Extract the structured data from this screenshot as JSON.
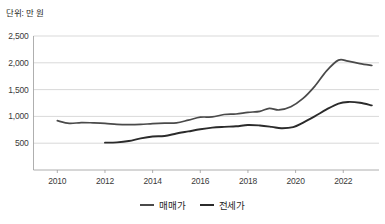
{
  "unit_note": "단위: 만 원",
  "legend": {
    "position": "bottom-center",
    "items": [
      {
        "label": "매매가",
        "color": "#4a4a4a"
      },
      {
        "label": "전세가",
        "color": "#2b2b2b"
      }
    ]
  },
  "axes": {
    "y_ticks": [
      "2,500",
      "2,000",
      "1,500",
      "1,000",
      "500"
    ],
    "x_ticks": [
      "2010",
      "2012",
      "2014",
      "2016",
      "2018",
      "2020",
      "2022"
    ]
  },
  "chart_data": {
    "type": "line",
    "title": "",
    "subtitle": "",
    "xlabel": "",
    "ylabel": "단위: 만 원",
    "xlim": [
      2009,
      2023.5
    ],
    "ylim": [
      0,
      2500
    ],
    "yticks": [
      500,
      1000,
      1500,
      2000,
      2500
    ],
    "xticks": [
      2010,
      2012,
      2014,
      2016,
      2018,
      2020,
      2022
    ],
    "grid": "horizontal",
    "legend_position": "bottom-center",
    "series": [
      {
        "name": "매매가",
        "color": "#4a4a4a",
        "x": [
          2010.0,
          2010.5,
          2011.0,
          2011.5,
          2012.0,
          2012.5,
          2013.0,
          2013.5,
          2014.0,
          2014.5,
          2015.0,
          2015.5,
          2016.0,
          2016.5,
          2017.0,
          2017.5,
          2018.0,
          2018.5,
          2018.9,
          2019.3,
          2019.8,
          2020.3,
          2020.8,
          2021.3,
          2021.8,
          2022.2,
          2022.7,
          2023.2
        ],
        "values": [
          920,
          870,
          885,
          880,
          870,
          850,
          845,
          850,
          865,
          875,
          880,
          930,
          985,
          990,
          1035,
          1045,
          1075,
          1095,
          1150,
          1120,
          1180,
          1330,
          1560,
          1850,
          2050,
          2030,
          1985,
          1950
        ]
      },
      {
        "name": "전세가",
        "color": "#2b2b2b",
        "x": [
          2012.0,
          2012.5,
          2013.0,
          2013.5,
          2014.0,
          2014.5,
          2015.0,
          2015.5,
          2016.0,
          2016.5,
          2017.0,
          2017.5,
          2018.0,
          2018.5,
          2019.0,
          2019.4,
          2019.9,
          2020.3,
          2020.8,
          2021.3,
          2021.8,
          2022.2,
          2022.7,
          2023.2
        ],
        "values": [
          510,
          515,
          540,
          590,
          625,
          635,
          680,
          720,
          760,
          790,
          805,
          815,
          840,
          830,
          805,
          780,
          800,
          880,
          1000,
          1130,
          1240,
          1270,
          1255,
          1205
        ]
      }
    ]
  }
}
